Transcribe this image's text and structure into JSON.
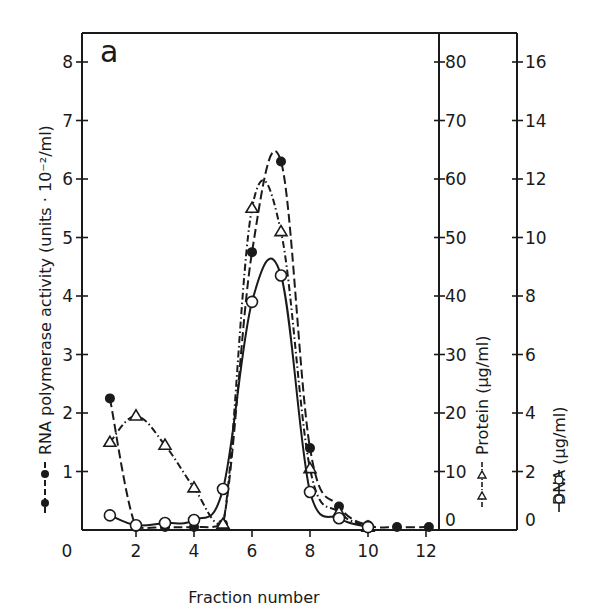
{
  "chart_data": {
    "type": "line",
    "title": "",
    "panel_label": "a",
    "xlabel": "Fraction number",
    "x_ticks": [
      0,
      2,
      4,
      6,
      8,
      10,
      12
    ],
    "xlim": [
      0,
      12.5
    ],
    "axes": [
      {
        "id": "left",
        "label": "RNA polymerase activity (units · 10⁻²/ml)",
        "ticks": [
          1,
          2,
          3,
          4,
          5,
          6,
          7,
          8
        ],
        "ylim": [
          0,
          8.5
        ]
      },
      {
        "id": "protein",
        "label": "Protein (µg/ml)",
        "ticks": [
          0,
          10,
          20,
          30,
          40,
          50,
          60,
          70,
          80
        ],
        "ylim": [
          0,
          85
        ]
      },
      {
        "id": "dna",
        "label": "DNA (µg/ml)",
        "ticks": [
          0,
          2,
          4,
          6,
          8,
          10,
          12,
          14,
          16
        ],
        "ylim": [
          0,
          17
        ]
      }
    ],
    "series": [
      {
        "name": "RNA polymerase activity",
        "marker": "filled-circle",
        "line": "dashed",
        "axis": "left",
        "x": [
          1.1,
          2,
          3,
          4,
          5,
          6,
          7,
          8,
          9,
          10,
          11,
          12.1
        ],
        "y": [
          2.25,
          0.05,
          0.05,
          0.05,
          0.1,
          4.75,
          6.3,
          1.4,
          0.4,
          0.08,
          0.05,
          0.05
        ]
      },
      {
        "name": "Protein",
        "marker": "open-triangle",
        "line": "dash-dot",
        "axis": "protein",
        "x": [
          1.1,
          2,
          3,
          4,
          5,
          6,
          7,
          8,
          9,
          10
        ],
        "y": [
          15,
          19.5,
          14.5,
          7.2,
          1,
          55,
          51,
          10.5,
          3,
          0.5
        ]
      },
      {
        "name": "DNA",
        "marker": "open-circle",
        "line": "solid",
        "axis": "dna",
        "x": [
          1.1,
          2,
          3,
          4,
          5,
          6,
          7,
          8,
          9,
          10
        ],
        "y": [
          0.5,
          0.16,
          0.24,
          0.34,
          1.4,
          7.8,
          8.7,
          1.3,
          0.4,
          0.1
        ]
      }
    ],
    "grid": false,
    "legend": "inline in axis labels"
  }
}
